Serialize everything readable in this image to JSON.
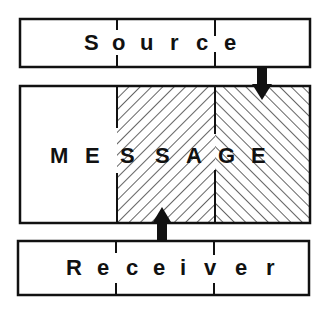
{
  "diagram": {
    "source": {
      "label": "Source",
      "letters": [
        "S",
        "o",
        "u",
        "r",
        "c",
        "e"
      ]
    },
    "message": {
      "label": "MESSAGE",
      "letters": [
        "M",
        "E",
        "S",
        "S",
        "A",
        "G",
        "E"
      ]
    },
    "receiver": {
      "label": "Receiver",
      "letters": [
        "R",
        "e",
        "c",
        "e",
        "i",
        "v",
        "e",
        "r"
      ]
    },
    "arrows": [
      {
        "from": "source",
        "to": "message",
        "direction": "down"
      },
      {
        "from": "receiver",
        "to": "message",
        "direction": "up"
      }
    ],
    "colors": {
      "stroke": "#111111",
      "background": "#ffffff"
    }
  }
}
